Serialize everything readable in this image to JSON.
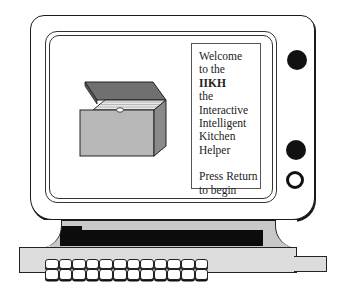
{
  "illustration": {
    "subject": "vintage-computer-monitor",
    "screen": {
      "left_graphic": "open-box-icon",
      "welcome_panel": {
        "lines": [
          "Welcome",
          "to the",
          "IIKH",
          "the",
          "Interactive",
          "Intelligent",
          "Kitchen",
          "Helper"
        ],
        "prompt_lines": [
          "Press Return",
          "to begin"
        ]
      }
    },
    "controls": [
      "knob-filled",
      "knob-filled",
      "knob-ring"
    ],
    "keyboard": {
      "rows": 2,
      "keys_per_row": 12
    },
    "colors": {
      "outline": "#1a1a1a",
      "box_front": "#b8b8b8",
      "box_side": "#8a8a8a",
      "box_lid": "#6e6e6e",
      "stand": "#c8c8c8",
      "keyboard": "#dcdcdc"
    }
  }
}
